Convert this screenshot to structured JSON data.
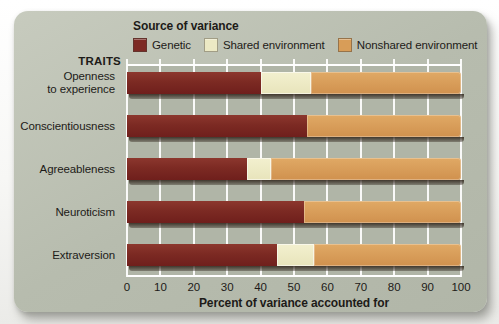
{
  "page": {
    "legend_title": "Source of variance",
    "traits_heading": "TRAITS",
    "axis_title": "Percent of variance accounted for",
    "trait_lines": [
      [
        "Openness",
        "to experience"
      ],
      [
        "Conscientiousness"
      ],
      [
        "Agreeableness"
      ],
      [
        "Neuroticism"
      ],
      [
        "Extraversion"
      ]
    ]
  },
  "legend": {
    "items": [
      {
        "label": "Genetic",
        "color": "#7d2a24"
      },
      {
        "label": "Shared environment",
        "color": "#ece9c4"
      },
      {
        "label": "Nonshared environment",
        "color": "#d89d58"
      }
    ]
  },
  "chart_data": {
    "type": "bar",
    "orientation": "horizontal",
    "stacked": true,
    "title": "",
    "xlabel": "Percent of variance accounted for",
    "ylabel": "TRAITS",
    "categories": [
      "Openness to experience",
      "Conscientiousness",
      "Agreeableness",
      "Neuroticism",
      "Extraversion"
    ],
    "series": [
      {
        "name": "Genetic",
        "color": "#7d2a24",
        "values": [
          40,
          54,
          36,
          53,
          45
        ]
      },
      {
        "name": "Shared environment",
        "color": "#ece9c4",
        "values": [
          15,
          0,
          7,
          0,
          11
        ]
      },
      {
        "name": "Nonshared environment",
        "color": "#d89d58",
        "values": [
          45,
          46,
          57,
          47,
          44
        ]
      }
    ],
    "xlim": [
      0,
      100
    ],
    "xticks": [
      0,
      10,
      20,
      30,
      40,
      50,
      60,
      70,
      80,
      90,
      100
    ],
    "grid": true,
    "gridline_color": "#ffffff",
    "plot_background": "#b0b5a7",
    "card_background": "#b7bcae",
    "legend_position": "top"
  }
}
